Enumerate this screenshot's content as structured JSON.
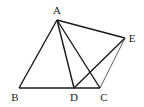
{
  "diagram": {
    "type": "geometry",
    "points": {
      "A": {
        "label": "A",
        "x": 57,
        "y": 20,
        "lx": 57,
        "ly": 14
      },
      "B": {
        "label": "B",
        "x": 19,
        "y": 88,
        "lx": 15,
        "ly": 101
      },
      "C": {
        "label": "C",
        "x": 100,
        "y": 88,
        "lx": 104,
        "ly": 101
      },
      "D": {
        "label": "D",
        "x": 74,
        "y": 88,
        "lx": 74,
        "ly": 101
      },
      "E": {
        "label": "E",
        "x": 125,
        "y": 38,
        "lx": 132,
        "ly": 42
      }
    },
    "segments": [
      {
        "from": "A",
        "to": "B",
        "style": "bold"
      },
      {
        "from": "B",
        "to": "C",
        "style": "bold"
      },
      {
        "from": "A",
        "to": "C",
        "style": "bold"
      },
      {
        "from": "A",
        "to": "D",
        "style": "bold"
      },
      {
        "from": "A",
        "to": "E",
        "style": "bold"
      },
      {
        "from": "D",
        "to": "E",
        "style": "bold"
      },
      {
        "from": "C",
        "to": "E",
        "style": "thin"
      }
    ]
  }
}
